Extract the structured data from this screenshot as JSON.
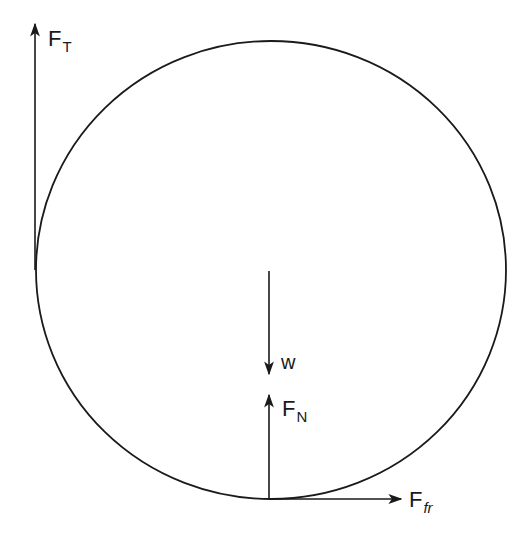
{
  "diagram": {
    "type": "free-body diagram",
    "colors": {
      "stroke": "#1a1a1a",
      "background": "#ffffff"
    },
    "circle": {
      "cx": 271,
      "cy": 270,
      "rx": 235,
      "ry": 229
    },
    "forces": [
      {
        "id": "tension",
        "label_main": "F",
        "label_sub": "T",
        "sub_italic": false,
        "direction": "up",
        "from": [
          35,
          270
        ],
        "to": [
          35,
          24
        ]
      },
      {
        "id": "weight",
        "label_main": "w",
        "label_sub": "",
        "sub_italic": false,
        "direction": "down",
        "from": [
          269,
          271
        ],
        "to": [
          269,
          374
        ]
      },
      {
        "id": "normal",
        "label_main": "F",
        "label_sub": "N",
        "sub_italic": false,
        "direction": "up",
        "from": [
          269,
          499
        ],
        "to": [
          269,
          395
        ]
      },
      {
        "id": "friction",
        "label_main": "F",
        "label_sub": "fr",
        "sub_italic": true,
        "direction": "right",
        "from": [
          269,
          499
        ],
        "to": [
          401,
          499
        ]
      }
    ]
  }
}
